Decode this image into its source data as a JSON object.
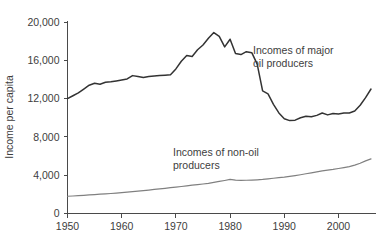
{
  "chart_data": {
    "type": "line",
    "title": "",
    "subtitle": "",
    "xlabel": "",
    "ylabel": "Income per capita",
    "xlim": [
      1950,
      2006
    ],
    "ylim": [
      0,
      20000
    ],
    "grid": false,
    "legend_position": "inline-annotations",
    "x_ticks": [
      "1950",
      "1960",
      "1970",
      "1980",
      "1990",
      "2000"
    ],
    "x_tick_values": [
      1950,
      1960,
      1970,
      1980,
      1990,
      2000
    ],
    "y_ticks": [
      "0",
      "4,000",
      "8,000",
      "12,000",
      "16,000",
      "20,000"
    ],
    "y_tick_values": [
      0,
      4000,
      8000,
      12000,
      16000,
      20000
    ],
    "x": [
      1950,
      1951,
      1952,
      1953,
      1954,
      1955,
      1956,
      1957,
      1958,
      1959,
      1960,
      1961,
      1962,
      1963,
      1964,
      1965,
      1966,
      1967,
      1968,
      1969,
      1970,
      1971,
      1972,
      1973,
      1974,
      1975,
      1976,
      1977,
      1978,
      1979,
      1980,
      1981,
      1982,
      1983,
      1984,
      1985,
      1986,
      1987,
      1988,
      1989,
      1990,
      1991,
      1992,
      1993,
      1994,
      1995,
      1996,
      1997,
      1998,
      1999,
      2000,
      2001,
      2002,
      2003,
      2004,
      2005,
      2006
    ],
    "series": [
      {
        "name": "Incomes of major oil producers",
        "color": "#333333",
        "annotation_lines": [
          "Incomes of major",
          "oil producers"
        ],
        "values": [
          12000,
          12300,
          12600,
          13000,
          13400,
          13600,
          13500,
          13700,
          13750,
          13850,
          13950,
          14050,
          14400,
          14300,
          14200,
          14300,
          14350,
          14400,
          14450,
          14500,
          15100,
          15900,
          16500,
          16400,
          17100,
          17600,
          18300,
          18900,
          18500,
          17400,
          18200,
          16700,
          16600,
          16900,
          16800,
          15600,
          12800,
          12500,
          11400,
          10500,
          9900,
          9700,
          9750,
          10000,
          10150,
          10100,
          10250,
          10500,
          10300,
          10450,
          10400,
          10500,
          10500,
          10700,
          11300,
          12100,
          13000
        ]
      },
      {
        "name": "Incomes of non-oil producers",
        "color": "#808080",
        "annotation_lines": [
          "Incomes of non-oil",
          "producers"
        ],
        "values": [
          1800,
          1830,
          1860,
          1900,
          1940,
          1980,
          2020,
          2060,
          2090,
          2130,
          2180,
          2230,
          2280,
          2330,
          2390,
          2450,
          2510,
          2570,
          2630,
          2700,
          2760,
          2820,
          2890,
          2960,
          3020,
          3080,
          3150,
          3250,
          3350,
          3450,
          3560,
          3480,
          3460,
          3470,
          3490,
          3520,
          3560,
          3620,
          3680,
          3740,
          3800,
          3880,
          3960,
          4050,
          4150,
          4250,
          4350,
          4450,
          4520,
          4600,
          4700,
          4800,
          4900,
          5050,
          5250,
          5500,
          5700
        ]
      }
    ],
    "annotations": [
      {
        "name": "major-oil-producers-label",
        "lines": [
          "Incomes of major",
          "oil producers"
        ],
        "x_px": 253,
        "y_px": 54
      },
      {
        "name": "non-oil-producers-label",
        "lines": [
          "Incomes of non-oil",
          "producers"
        ],
        "x_px": 173,
        "y_px": 156
      }
    ]
  }
}
